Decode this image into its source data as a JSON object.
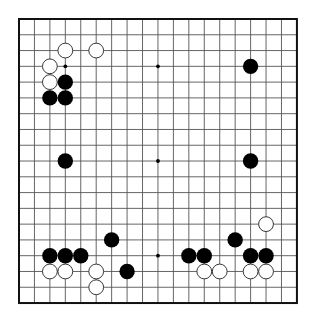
{
  "board": {
    "size": 19,
    "origin_x": 19,
    "origin_y": 19,
    "spacing_x": 15.44,
    "spacing_y": 15.78,
    "stone_radius": 7.4,
    "line_color": "#555555",
    "border_color": "#111111",
    "background": "#ffffff",
    "black_color": "#000000",
    "white_fill": "#ffffff",
    "white_stroke": "#222222",
    "star_points": [
      [
        3,
        3
      ],
      [
        9,
        3
      ],
      [
        15,
        3
      ],
      [
        3,
        9
      ],
      [
        9,
        9
      ],
      [
        15,
        9
      ],
      [
        3,
        15
      ],
      [
        9,
        15
      ],
      [
        15,
        15
      ]
    ]
  },
  "stones": [
    {
      "color": "white",
      "col": 3,
      "row": 2
    },
    {
      "color": "white",
      "col": 5,
      "row": 2
    },
    {
      "color": "white",
      "col": 2,
      "row": 3
    },
    {
      "color": "white",
      "col": 2,
      "row": 4
    },
    {
      "color": "black",
      "col": 3,
      "row": 4
    },
    {
      "color": "black",
      "col": 2,
      "row": 5
    },
    {
      "color": "black",
      "col": 3,
      "row": 5
    },
    {
      "color": "black",
      "col": 15,
      "row": 3
    },
    {
      "color": "black",
      "col": 3,
      "row": 9
    },
    {
      "color": "black",
      "col": 15,
      "row": 9
    },
    {
      "color": "white",
      "col": 16,
      "row": 13
    },
    {
      "color": "black",
      "col": 6,
      "row": 14
    },
    {
      "color": "black",
      "col": 14,
      "row": 14
    },
    {
      "color": "black",
      "col": 2,
      "row": 15
    },
    {
      "color": "black",
      "col": 3,
      "row": 15
    },
    {
      "color": "black",
      "col": 4,
      "row": 15
    },
    {
      "color": "black",
      "col": 11,
      "row": 15
    },
    {
      "color": "black",
      "col": 12,
      "row": 15
    },
    {
      "color": "black",
      "col": 15,
      "row": 15
    },
    {
      "color": "black",
      "col": 16,
      "row": 15
    },
    {
      "color": "white",
      "col": 2,
      "row": 16
    },
    {
      "color": "white",
      "col": 3,
      "row": 16
    },
    {
      "color": "white",
      "col": 5,
      "row": 16
    },
    {
      "color": "black",
      "col": 7,
      "row": 16
    },
    {
      "color": "white",
      "col": 12,
      "row": 16
    },
    {
      "color": "white",
      "col": 13,
      "row": 16
    },
    {
      "color": "white",
      "col": 15,
      "row": 16
    },
    {
      "color": "white",
      "col": 16,
      "row": 16
    },
    {
      "color": "white",
      "col": 5,
      "row": 17
    }
  ]
}
